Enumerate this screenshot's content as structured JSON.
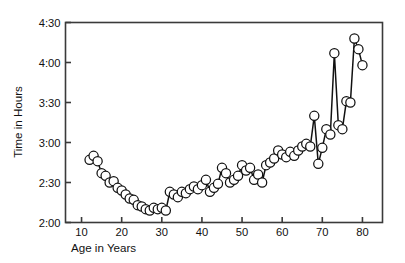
{
  "chart_data": {
    "type": "line",
    "title": "",
    "subtitle": "",
    "xlabel": "Age in Years",
    "ylabel": "Time in Hours",
    "xlim": [
      6,
      85
    ],
    "ylim": [
      120,
      270
    ],
    "xticks": [
      10,
      20,
      30,
      40,
      50,
      60,
      70,
      80
    ],
    "xticklabels": [
      "10",
      "20",
      "30",
      "40",
      "50",
      "60",
      "70",
      "80"
    ],
    "yticks": [
      120,
      150,
      180,
      210,
      240,
      270
    ],
    "yticklabels": [
      "2:00",
      "2:30",
      "3:00",
      "3:30",
      "4:00",
      "4:30"
    ],
    "y_unit": "minutes",
    "y_tick_interval_minutes": 30,
    "grid": false,
    "legend": null,
    "marker": "open-circle",
    "marker_size": 4.6,
    "line_color": "#111111",
    "marker_fill": "#ffffff",
    "marker_edge": "#111111",
    "frame_color": "#3a3a3a",
    "series": [
      {
        "name": "Time in Hours by Age",
        "x": [
          12,
          13,
          14,
          15,
          16,
          17,
          18,
          19,
          20,
          21,
          22,
          23,
          24,
          25,
          26,
          27,
          28,
          29,
          30,
          31,
          32,
          33,
          34,
          35,
          36,
          37,
          38,
          39,
          40,
          41,
          42,
          43,
          44,
          45,
          46,
          47,
          48,
          49,
          50,
          51,
          52,
          53,
          54,
          55,
          56,
          57,
          58,
          59,
          60,
          61,
          62,
          63,
          64,
          65,
          66,
          67,
          68,
          69,
          70,
          71,
          72,
          73,
          74,
          75,
          76,
          77,
          78,
          79,
          80
        ],
        "y": [
          167,
          170,
          166,
          157,
          155,
          150,
          151,
          146,
          144,
          141,
          138,
          137,
          133,
          132,
          130,
          129,
          131,
          130,
          131,
          129,
          143,
          141,
          139,
          143,
          142,
          145,
          147,
          145,
          148,
          152,
          143,
          146,
          149,
          161,
          157,
          150,
          152,
          155,
          163,
          159,
          161,
          152,
          156,
          150,
          163,
          165,
          168,
          174,
          171,
          169,
          173,
          170,
          174,
          177,
          179,
          177,
          200,
          164,
          176,
          190,
          186,
          247,
          193,
          190,
          211,
          210,
          258,
          250,
          238
        ],
        "y_labels": [
          "2:47",
          "2:50",
          "2:46",
          "2:37",
          "2:35",
          "2:30",
          "2:31",
          "2:26",
          "2:24",
          "2:21",
          "2:18",
          "2:17",
          "2:13",
          "2:12",
          "2:10",
          "2:09",
          "2:11",
          "2:10",
          "2:11",
          "2:09",
          "2:23",
          "2:21",
          "2:19",
          "2:23",
          "2:22",
          "2:25",
          "2:27",
          "2:25",
          "2:28",
          "2:32",
          "2:23",
          "2:26",
          "2:29",
          "2:41",
          "2:37",
          "2:30",
          "2:32",
          "2:35",
          "2:43",
          "2:39",
          "2:41",
          "2:32",
          "2:36",
          "2:30",
          "2:43",
          "2:45",
          "2:48",
          "2:54",
          "2:51",
          "2:49",
          "2:53",
          "2:50",
          "2:54",
          "2:57",
          "2:59",
          "2:57",
          "3:20",
          "2:44",
          "2:56",
          "3:10",
          "3:06",
          "4:07",
          "3:13",
          "3:10",
          "3:31",
          "3:30",
          "4:18",
          "4:10",
          "3:58"
        ]
      }
    ]
  },
  "figure": {
    "y_axis_label": "Time in Hours",
    "x_axis_label": "Age in Years"
  }
}
